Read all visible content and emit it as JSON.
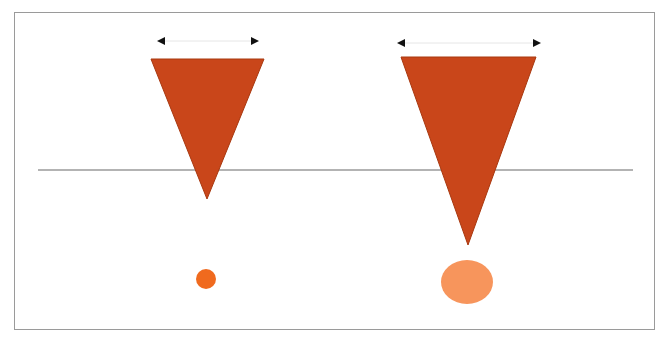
{
  "diagram": {
    "colors": {
      "triangle": "#C9461A",
      "triangle_edge": "#A8380F",
      "small_circle": "#F06A1E",
      "large_circle": "#F7955C",
      "baseline": "#9a9a9a",
      "arrow": "#111111",
      "frame": "#9a9a9a"
    },
    "left_group": {
      "arrow": {
        "x1": 152,
        "x2": 264,
        "y": 41
      },
      "triangle": {
        "top_left": [
          151,
          59
        ],
        "top_right": [
          264,
          59
        ],
        "tip": [
          207,
          199
        ]
      },
      "circle": {
        "cx": 206,
        "cy": 279,
        "rx": 10,
        "ry": 10
      }
    },
    "right_group": {
      "arrow": {
        "x1": 392,
        "x2": 546,
        "y": 43
      },
      "triangle": {
        "top_left": [
          401,
          57
        ],
        "top_right": [
          536,
          57
        ],
        "tip": [
          468,
          245
        ]
      },
      "circle": {
        "cx": 467,
        "cy": 282,
        "rx": 26,
        "ry": 22
      }
    },
    "baseline": {
      "x1": 38,
      "x2": 633,
      "y": 170
    }
  }
}
